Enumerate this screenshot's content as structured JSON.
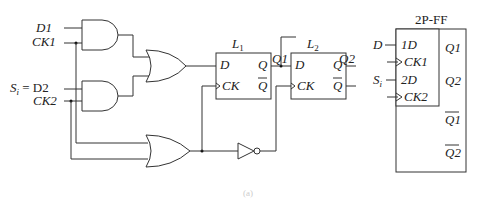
{
  "diagram": {
    "inputs": {
      "d1": "D1",
      "ck1": "CK1",
      "si_eq": "S",
      "si_sub": "i",
      "si_rest": " = D2",
      "ck2": "CK2"
    },
    "latch1": {
      "name": "L",
      "sub": "1",
      "d": "D",
      "q": "Q",
      "ck": "CK",
      "qbar": "Q",
      "out_label": "Q1"
    },
    "latch2": {
      "name": "L",
      "sub": "2",
      "d": "D",
      "q": "Q",
      "ck": "CK",
      "qbar": "Q",
      "out_label": "Q2"
    },
    "ff_symbol": {
      "title": "2P-FF",
      "input_d": "D",
      "input_s": "S",
      "input_s_sub": "i",
      "pin_1d": "1D",
      "pin_ck1": "CK1",
      "pin_2d": "2D",
      "pin_ck2": "CK2",
      "out_q1": "Q1",
      "out_q2": "Q2",
      "out_q1bar": "Q1",
      "out_q2bar": "Q2"
    },
    "caption": "(a)"
  }
}
